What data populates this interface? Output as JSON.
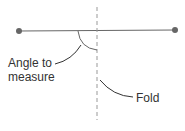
{
  "diagram": {
    "labels": {
      "angle": [
        "Angle to",
        "measure"
      ],
      "fold": "Fold"
    },
    "colors": {
      "line": "#666666",
      "dot": "#666666",
      "fold": "#999999",
      "text": "#333333"
    }
  }
}
